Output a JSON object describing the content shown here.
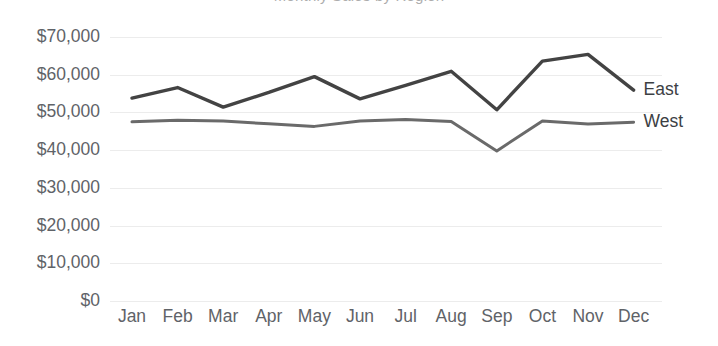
{
  "chart_data": {
    "type": "line",
    "title": "Monthly Sales by Region",
    "xlabel": "",
    "ylabel": "",
    "categories": [
      "Jan",
      "Feb",
      "Mar",
      "Apr",
      "May",
      "Jun",
      "Jul",
      "Aug",
      "Sep",
      "Oct",
      "Nov",
      "Dec"
    ],
    "series": [
      {
        "name": "East",
        "color": "#434343",
        "values": [
          53800,
          56600,
          51400,
          55300,
          59500,
          53600,
          57200,
          60900,
          50700,
          63600,
          65400,
          55900
        ]
      },
      {
        "name": "West",
        "color": "#6a6a6a",
        "values": [
          47500,
          47900,
          47700,
          47000,
          46300,
          47700,
          48100,
          47600,
          39800,
          47700,
          46900,
          47400
        ]
      }
    ],
    "ylim": [
      0,
      70000
    ],
    "ytick_labels": [
      "$70,000",
      "$60,000",
      "$50,000",
      "$40,000",
      "$30,000",
      "$20,000",
      "$10,000",
      "$0"
    ],
    "ytick_values": [
      70000,
      60000,
      50000,
      40000,
      30000,
      20000,
      10000,
      0
    ],
    "grid": true,
    "grid_color": "#ececec",
    "legend_position": "inline-right",
    "background": "#ffffff"
  }
}
